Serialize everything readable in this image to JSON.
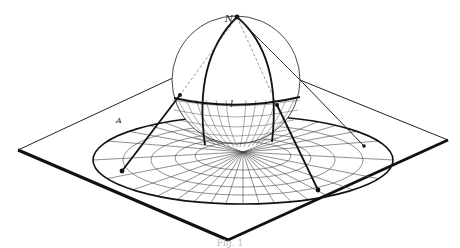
{
  "figure": {
    "labels": {
      "north_pole": "N",
      "circle_label": "l",
      "disk_label": "A"
    },
    "caption": "Fig. 1",
    "colors": {
      "ink": "#111111",
      "grid": "#444444",
      "background": "#ffffff"
    }
  }
}
